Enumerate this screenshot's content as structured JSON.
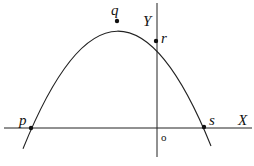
{
  "diagram": {
    "type": "parabola-on-axes",
    "axes": {
      "x_label": "X",
      "y_label": "Y",
      "origin_label": "o"
    },
    "points": [
      {
        "id": "p",
        "label": "p",
        "role": "x-intercept (left)"
      },
      {
        "id": "q",
        "label": "q",
        "role": "vertex (maximum)"
      },
      {
        "id": "r",
        "label": "r",
        "role": "y-intercept"
      },
      {
        "id": "s",
        "label": "s",
        "role": "x-intercept (right)"
      }
    ],
    "colors": {
      "stroke": "#111111",
      "background": "#ffffff"
    }
  }
}
